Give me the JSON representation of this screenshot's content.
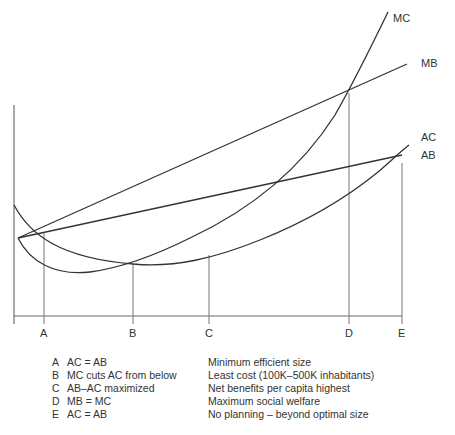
{
  "diagram": {
    "curves": [
      {
        "id": "MC",
        "label": "MC"
      },
      {
        "id": "MB",
        "label": "MB"
      },
      {
        "id": "AC",
        "label": "AC"
      },
      {
        "id": "AB",
        "label": "AB"
      }
    ],
    "x_ticks": [
      "A",
      "B",
      "C",
      "D",
      "E"
    ]
  },
  "legend": [
    {
      "key": "A",
      "condition": "AC = AB",
      "meaning": "Minimum efficient size"
    },
    {
      "key": "B",
      "condition": "MC cuts AC from below",
      "meaning": "Least cost (100K–500K inhabitants)"
    },
    {
      "key": "C",
      "condition": "AB–AC maximized",
      "meaning": "Net benefits per capita highest"
    },
    {
      "key": "D",
      "condition": "MB = MC",
      "meaning": "Maximum social welfare"
    },
    {
      "key": "E",
      "condition": "AC = AB",
      "meaning": "No planning – beyond optimal size"
    }
  ]
}
